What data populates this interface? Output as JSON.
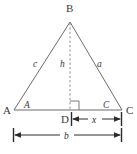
{
  "diagram": {
    "type": "triangle-with-altitude",
    "canvas": {
      "width": 137,
      "height": 154,
      "background": "#ffffff"
    },
    "colors": {
      "edge": "#6b6b6b",
      "altitude": "#8a8a8a",
      "dimension": "#2b2b2b",
      "label": "#3a3a3a",
      "background": "#ffffff"
    },
    "vertices": [
      {
        "id": "A",
        "label": "A",
        "x": 14,
        "y": 110,
        "label_x": 3,
        "label_y": 114
      },
      {
        "id": "B",
        "label": "B",
        "x": 70,
        "y": 22,
        "label_x": 66,
        "label_y": 12
      },
      {
        "id": "C",
        "label": "C",
        "x": 122,
        "y": 110,
        "label_x": 126,
        "label_y": 114
      },
      {
        "id": "D",
        "label": "D",
        "x": 70,
        "y": 110,
        "label_x": 62,
        "label_y": 122
      }
    ],
    "sides": [
      {
        "id": "AB",
        "label": "c",
        "label_x": 33,
        "label_y": 66,
        "from": "A",
        "to": "B"
      },
      {
        "id": "BC",
        "label": "a",
        "label_x": 98,
        "label_y": 66,
        "from": "B",
        "to": "C"
      },
      {
        "id": "AC",
        "label": "b",
        "from": "A",
        "to": "C"
      }
    ],
    "altitude": {
      "label": "h",
      "label_x": 62,
      "label_y": 66,
      "from": "B",
      "to": "D",
      "style": "dashed"
    },
    "angles": [
      {
        "id": "angle-A",
        "label": "A",
        "label_x": 25,
        "label_y": 107
      },
      {
        "id": "angle-C",
        "label": "C",
        "label_x": 104,
        "label_y": 107
      },
      {
        "id": "angle-D",
        "label": "",
        "type": "right-angle",
        "x": 70,
        "y": 110
      }
    ],
    "dimensions": [
      {
        "id": "dim-x",
        "label": "x",
        "label_x": 93,
        "label_y": 124,
        "x1": 72,
        "x2": 122,
        "y": 119,
        "from": "D",
        "to": "C"
      },
      {
        "id": "dim-b",
        "label": "b",
        "label_x": 65,
        "label_y": 140,
        "x1": 13,
        "x2": 122,
        "y": 135,
        "from": "A",
        "to": "C"
      }
    ]
  }
}
